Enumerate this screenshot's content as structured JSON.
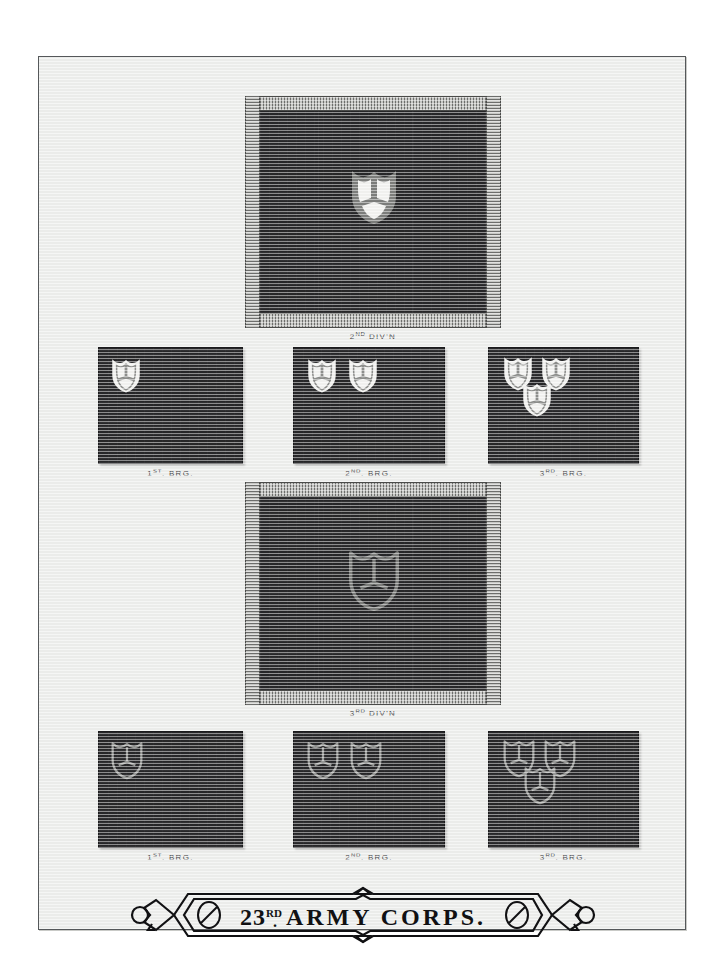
{
  "plate": {
    "title": "23RD ARMY CORPS.",
    "title_number": "23",
    "title_ordinal": "RD",
    "title_rest": "ARMY  CORPS.",
    "background_color": "#edeeec",
    "frame_color": "#55585a"
  },
  "colors": {
    "flag_field": "#2c2c2e",
    "fringe": "#9a9b99",
    "badge_white": "#f2f2f0",
    "badge_gray": "#7c7d7b",
    "caption_text": "#4a4a4c",
    "banner_ink": "#111113"
  },
  "divisions": [
    {
      "id": "second-division",
      "caption": "2ND DIV'N",
      "caption_main": "2",
      "caption_ordinal": "ND",
      "caption_tail": " DIV'N",
      "badge": "shield-white-filled",
      "badge_style": "filled",
      "flag_type": "division-flag-with-fringe",
      "brigades": [
        {
          "id": "second-division-1st-brigade",
          "caption": "1ST. BRG.",
          "caption_main": "1",
          "caption_ordinal": "ST",
          "caption_tail": ". BRG.",
          "shield_count": 1,
          "badge_style": "filled"
        },
        {
          "id": "second-division-2nd-brigade",
          "caption": "2ND. BRG.",
          "caption_main": "2",
          "caption_ordinal": "ND",
          "caption_tail": ". BRG.",
          "shield_count": 2,
          "badge_style": "filled"
        },
        {
          "id": "second-division-3rd-brigade",
          "caption": "3RD. BRG.",
          "caption_main": "3",
          "caption_ordinal": "RD",
          "caption_tail": ". BRG.",
          "shield_count": 3,
          "badge_style": "filled"
        }
      ]
    },
    {
      "id": "third-division",
      "caption": "3RD DIV'N",
      "caption_main": "3",
      "caption_ordinal": "RD",
      "caption_tail": " DIV'N",
      "badge": "shield-gray-outline",
      "badge_style": "outline",
      "flag_type": "division-flag-with-fringe",
      "brigades": [
        {
          "id": "third-division-1st-brigade",
          "caption": "1ST. BRG.",
          "caption_main": "1",
          "caption_ordinal": "ST",
          "caption_tail": ". BRG.",
          "shield_count": 1,
          "badge_style": "outline"
        },
        {
          "id": "third-division-2nd-brigade",
          "caption": "2ND. BRG.",
          "caption_main": "2",
          "caption_ordinal": "ND",
          "caption_tail": ". BRG.",
          "shield_count": 2,
          "badge_style": "outline"
        },
        {
          "id": "third-division-3rd-brigade",
          "caption": "3RD. BRG.",
          "caption_main": "3",
          "caption_ordinal": "RD",
          "caption_tail": ". BRG.",
          "shield_count": 3,
          "badge_style": "outline"
        }
      ]
    }
  ]
}
